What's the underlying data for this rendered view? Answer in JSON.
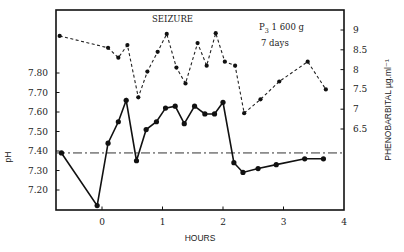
{
  "chart_data": {
    "type": "line",
    "title": "",
    "xlabel": "HOURS",
    "ylabel": "pH",
    "y2label": "PHENOBARBITAL µg.ml⁻¹",
    "xlim": [
      -0.85,
      4
    ],
    "ylim": [
      7.1,
      7.95
    ],
    "y2lim": [
      5.6,
      9.5
    ],
    "x_ticks": [
      0,
      1,
      2,
      3,
      4
    ],
    "y_ticks": [
      "7.20",
      "7.30",
      "7.40",
      "7.50",
      "7.60",
      "7.70",
      "7.80"
    ],
    "y2_ticks": [
      "6.5",
      "7",
      "7.5",
      "8",
      "8.5",
      "9"
    ],
    "grid": false,
    "legend": null,
    "annotations": {
      "event": "SEIZURE",
      "subject_prefix": "P",
      "subject_sub": "3",
      "subject_weight": " 1 600 g",
      "age": "7 days"
    },
    "reference_line": {
      "name": "normal pH",
      "y": 7.39,
      "style": "dash-dot"
    },
    "series": [
      {
        "name": "pH",
        "axis": "left",
        "style": "solid",
        "x": [
          -0.67,
          -0.08,
          0.1,
          0.27,
          0.4,
          0.57,
          0.73,
          0.9,
          1.05,
          1.21,
          1.36,
          1.53,
          1.7,
          1.86,
          2.0,
          2.18,
          2.33,
          2.58,
          2.88,
          3.35,
          3.66
        ],
        "values": [
          7.39,
          7.12,
          7.44,
          7.55,
          7.66,
          7.35,
          7.51,
          7.55,
          7.62,
          7.63,
          7.54,
          7.63,
          7.59,
          7.59,
          7.65,
          7.34,
          7.29,
          7.31,
          7.33,
          7.36,
          7.36
        ]
      },
      {
        "name": "Phenobarbital (µg/ml)",
        "axis": "right",
        "style": "dashed",
        "x": [
          -0.7,
          0.1,
          0.27,
          0.42,
          0.6,
          0.75,
          0.92,
          1.07,
          1.23,
          1.38,
          1.58,
          1.73,
          1.88,
          2.03,
          2.2,
          2.35,
          2.62,
          2.93,
          3.4,
          3.7
        ],
        "values": [
          8.85,
          8.55,
          8.3,
          8.62,
          7.3,
          7.95,
          8.45,
          8.9,
          8.05,
          7.65,
          8.67,
          8.1,
          8.92,
          8.2,
          8.1,
          6.9,
          7.25,
          7.7,
          8.2,
          7.5
        ]
      }
    ]
  }
}
